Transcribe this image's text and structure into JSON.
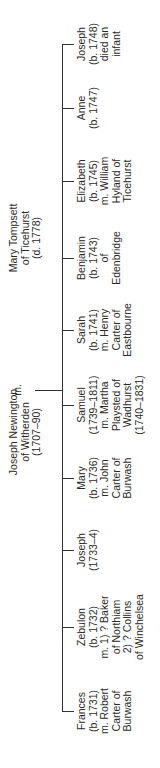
{
  "diagram": {
    "type": "family-tree",
    "orientation": "rotated-90-ccw",
    "parents": {
      "father": {
        "lines": [
          "Joseph Newington",
          "of Witherden",
          "(1707–90)"
        ]
      },
      "marriage_symbol": "m.",
      "mother": {
        "lines": [
          "Mary Tompsett",
          "of Ticehurst",
          "(d. 1778)"
        ]
      }
    },
    "children": [
      {
        "name": "Frances",
        "lines": [
          "Frances",
          "(b. 1731)",
          "m. Robert",
          "Carter of",
          "Burwash"
        ]
      },
      {
        "name": "Zebulon",
        "lines": [
          "Zebulon",
          "(b. 1732)",
          "m. 1) ? Baker",
          "of Northiam",
          "2) ? Collins",
          "of Winchelsea"
        ]
      },
      {
        "name": "Joseph",
        "lines": [
          "Joseph",
          "(1733–4)"
        ]
      },
      {
        "name": "Mary",
        "lines": [
          "Mary",
          "(b. 1736)",
          "m. John",
          "Carter of",
          "Burwash"
        ]
      },
      {
        "name": "Samuel",
        "lines": [
          "Samuel",
          "(1739–1811)",
          "m. Martha",
          "Playsted of",
          "Wadhurst",
          "(1740–1831)"
        ]
      },
      {
        "name": "Sarah",
        "lines": [
          "Sarah",
          "(b. 1741)",
          "m. Henry",
          "Carter of",
          "Eastbourne"
        ]
      },
      {
        "name": "Benjamin",
        "lines": [
          "Benjamin",
          "(b. 1743)",
          "of",
          "Edenbridge"
        ]
      },
      {
        "name": "Elizabeth",
        "lines": [
          "Elizabeth",
          "(b. 1745)",
          "m. William",
          "Hyland of",
          "Ticehurst"
        ]
      },
      {
        "name": "Anne",
        "lines": [
          "Anne",
          "(b. 1747)"
        ]
      },
      {
        "name": "Joseph",
        "lines": [
          "Joseph",
          "(b. 1748)",
          "died an",
          "infant"
        ]
      }
    ]
  }
}
